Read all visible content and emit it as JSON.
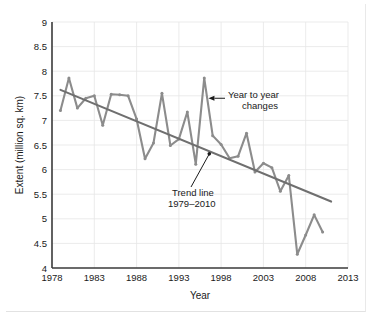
{
  "chart_data": {
    "type": "line",
    "title": "",
    "xlabel": "Year",
    "ylabel": "Extent (million sq. km)",
    "xlim": [
      1978,
      2013
    ],
    "ylim": [
      4,
      9
    ],
    "xticks": [
      1978,
      1983,
      1988,
      1993,
      1998,
      2003,
      2008,
      2013
    ],
    "yticks": [
      4,
      4.5,
      5,
      5.5,
      6,
      6.5,
      7,
      7.5,
      8,
      8.5,
      9
    ],
    "grid": true,
    "legend_position": "none",
    "series": [
      {
        "name": "Year to year changes",
        "color": "#8c8c8c",
        "x": [
          1979,
          1980,
          1981,
          1982,
          1983,
          1984,
          1985,
          1986,
          1987,
          1988,
          1989,
          1990,
          1991,
          1992,
          1993,
          1994,
          1995,
          1996,
          1997,
          1998,
          1999,
          2000,
          2001,
          2002,
          2003,
          2004,
          2005,
          2006,
          2007,
          2008,
          2009,
          2010
        ],
        "values": [
          7.2,
          7.86,
          7.25,
          7.45,
          7.5,
          6.9,
          7.53,
          7.52,
          7.5,
          7.03,
          6.22,
          6.54,
          7.55,
          6.49,
          6.62,
          7.17,
          6.11,
          7.86,
          6.69,
          6.51,
          6.23,
          6.27,
          6.74,
          5.95,
          6.13,
          6.04,
          5.56,
          5.88,
          4.28,
          4.67,
          5.08,
          4.73
        ]
      },
      {
        "name": "Trend line 1979–2010",
        "color": "#6f6f6f",
        "x": [
          1979,
          2011
        ],
        "values": [
          7.62,
          5.35
        ]
      }
    ],
    "annotations": [
      {
        "name": "year-to-year-changes",
        "line1": "Year to year",
        "line2": "changes",
        "points_to_x": 1996.5,
        "points_to_y": 7.45
      },
      {
        "name": "trend-line",
        "line1": "Trend line",
        "line2": "1979–2010",
        "points_to_x": 1996.6,
        "points_to_y": 6.32
      }
    ]
  }
}
